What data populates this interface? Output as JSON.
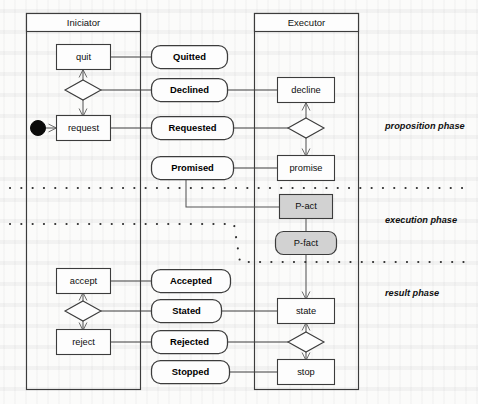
{
  "diagram": {
    "lanes": [
      {
        "id": "initiator",
        "title": "Iniciator"
      },
      {
        "id": "executor",
        "title": "Executor"
      }
    ],
    "phases": [
      {
        "id": "proposition",
        "label": "proposition phase"
      },
      {
        "id": "execution",
        "label": "execution phase"
      },
      {
        "id": "result",
        "label": "result phase"
      }
    ],
    "initiator_actions": [
      {
        "id": "quit",
        "label": "quit"
      },
      {
        "id": "request",
        "label": "request"
      },
      {
        "id": "accept",
        "label": "accept"
      },
      {
        "id": "reject",
        "label": "reject"
      }
    ],
    "executor_actions": [
      {
        "id": "decline",
        "label": "decline"
      },
      {
        "id": "promise",
        "label": "promise"
      },
      {
        "id": "p-act",
        "label": "P-act"
      },
      {
        "id": "p-fact",
        "label": "P-fact"
      },
      {
        "id": "state",
        "label": "state"
      },
      {
        "id": "stop",
        "label": "stop"
      }
    ],
    "states": [
      {
        "id": "quitted",
        "label": "Quitted"
      },
      {
        "id": "declined",
        "label": "Declined"
      },
      {
        "id": "requested",
        "label": "Requested"
      },
      {
        "id": "promised",
        "label": "Promised"
      },
      {
        "id": "accepted",
        "label": "Accepted"
      },
      {
        "id": "stated",
        "label": "Stated"
      },
      {
        "id": "rejected",
        "label": "Rejected"
      },
      {
        "id": "stopped",
        "label": "Stopped"
      }
    ],
    "colors": {
      "line": "#3c3c3c",
      "fill": "#fdfdfd",
      "gray_fill": "#d2d2d2",
      "text": "#0d0d0d",
      "page": "#fbfbfa"
    }
  }
}
